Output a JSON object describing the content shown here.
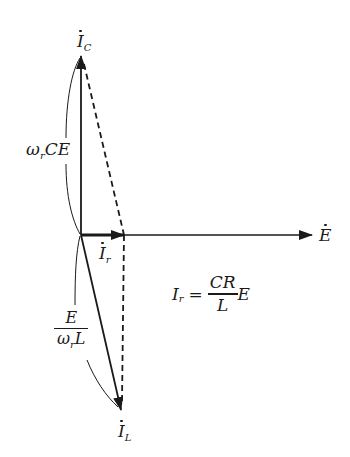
{
  "diagram": {
    "type": "phasor-diagram",
    "colors": {
      "stroke": "#1a1a1a",
      "background": "#ffffff"
    },
    "phasors": {
      "E": {
        "symbol": "E",
        "dotted": true,
        "direction": "horizontal-right"
      },
      "Ic": {
        "symbol": "I",
        "subscript": "C",
        "dotted": true,
        "direction": "vertical-up"
      },
      "Ir": {
        "symbol": "I",
        "subscript": "r",
        "dotted": true,
        "direction": "horizontal-right"
      },
      "IL": {
        "symbol": "I",
        "subscript": "L",
        "dotted": true,
        "direction": "down-right"
      }
    },
    "labels": {
      "ic_magnitude": {
        "omega": "ω",
        "omega_sub": "r",
        "rest": "CE"
      },
      "il_magnitude": {
        "numerator": "E",
        "den_omega": "ω",
        "den_sub": "r",
        "den_rest": "L"
      },
      "ir_formula": {
        "lhs": "I",
        "lhs_sub": "r",
        "equals": "=",
        "numerator": "CR",
        "denominator": "L",
        "suffix": "E"
      }
    }
  }
}
